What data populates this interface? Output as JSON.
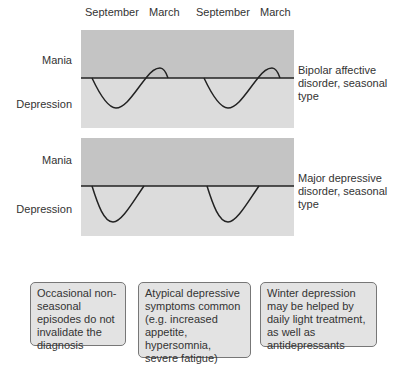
{
  "months": [
    "September",
    "March",
    "September",
    "March"
  ],
  "colors": {
    "mania_bg": "#c4c4c4",
    "depression_bg": "#dcdcdc",
    "line": "#222222",
    "box_bg": "#e3e3e3"
  },
  "panels": [
    {
      "mania_label": "Mania",
      "depression_label": "Depression",
      "side_label": "Bipolar affective disorder, seasonal type"
    },
    {
      "mania_label": "Mania",
      "depression_label": "Depression",
      "side_label": "Major depressive disorder, seasonal type"
    }
  ],
  "notes": [
    "Occasional non-seasonal episodes do not invalidate the diagnosis",
    "Atypical depressive symptoms common (e.g. increased appetite, hypersomnia, severe fatigue)",
    "Winter depression may be helped by daily light treatment, as well as antidepressants"
  ]
}
